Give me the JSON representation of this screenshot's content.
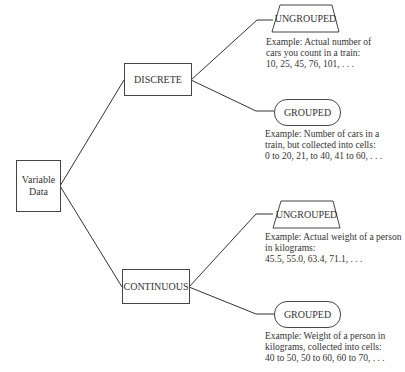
{
  "diagram": {
    "root": {
      "label_line1": "Variable",
      "label_line2": "Data"
    },
    "branches": [
      {
        "label": "DISCRETE",
        "children": [
          {
            "label": "UNGROUPED",
            "shape": "trapezoid",
            "example": [
              "Example: Actual number of",
              "cars you count in a train:",
              "10, 25, 45, 76, 101, . . ."
            ]
          },
          {
            "label": "GROUPED",
            "shape": "pill",
            "example": [
              "Example: Number of cars in a",
              "train, but collected into cells:",
              "0 to 20, 21, to 40, 41 to 60, . . ."
            ]
          }
        ]
      },
      {
        "label": "CONTINUOUS",
        "children": [
          {
            "label": "UNGROUPED",
            "shape": "trapezoid",
            "example": [
              "Example: Actual weight of a person",
              "in kilograms:",
              "45.5, 55.0, 63.4, 71.1, . . ."
            ]
          },
          {
            "label": "GROUPED",
            "shape": "pill",
            "example": [
              "Example: Weight of a person in",
              "kilograms, collected into cells:",
              "40 to 50, 50 to 60, 60 to 70, . . ."
            ]
          }
        ]
      }
    ]
  },
  "colors": {
    "line": "#333333",
    "text": "#333333",
    "background": "#ffffff"
  }
}
